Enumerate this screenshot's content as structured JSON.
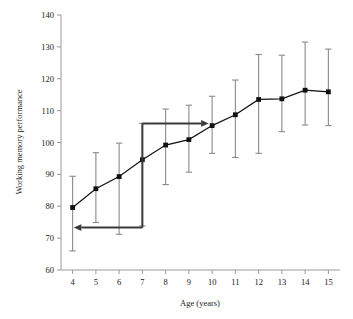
{
  "chart_data": {
    "type": "line",
    "title": "",
    "xlabel": "Age (years)",
    "ylabel": "Working memory performance",
    "xlim": [
      3.5,
      15.5
    ],
    "ylim": [
      60,
      140
    ],
    "ytick_step": 10,
    "grid": false,
    "legend": "none",
    "x": [
      4,
      5,
      6,
      7,
      8,
      9,
      10,
      11,
      12,
      13,
      14,
      15
    ],
    "xticklabels": [
      "4",
      "5",
      "6",
      "7",
      "8",
      "9",
      "10",
      "11",
      "12",
      "13",
      "14",
      "15"
    ],
    "yticklabels": [
      "60",
      "70",
      "80",
      "90",
      "100",
      "110",
      "120",
      "130",
      "140"
    ],
    "series": [
      {
        "name": "Working memory performance",
        "values": [
          79.6,
          85.5,
          89.3,
          94.6,
          99.2,
          100.9,
          105.3,
          108.7,
          113.5,
          113.7,
          116.4,
          115.9
        ],
        "err_low": [
          66.0,
          74.9,
          71.2,
          73.8,
          86.8,
          90.7,
          96.6,
          95.3,
          96.6,
          103.4,
          105.5,
          105.3
        ],
        "err_high": [
          89.4,
          96.8,
          99.8,
          106.0,
          110.5,
          111.7,
          114.5,
          119.6,
          127.6,
          127.4,
          131.5,
          129.3
        ],
        "marker": "square",
        "color": "#111111",
        "errorbar_color": "#8a8a8a"
      }
    ],
    "annotations": [
      {
        "name": "forward-arrow",
        "type": "arrow",
        "direction": "right",
        "y": 106.0,
        "x_start": 7.0,
        "x_end": 9.85,
        "color": "#3a3a3a"
      },
      {
        "name": "backward-arrow",
        "type": "arrow",
        "direction": "left",
        "y": 73.3,
        "x_start": 7.0,
        "x_end": 4.05,
        "color": "#3a3a3a"
      },
      {
        "name": "reference-connector",
        "type": "vline",
        "x": 7.0,
        "y_start": 73.3,
        "y_end": 106.0,
        "color": "#3a3a3a"
      }
    ],
    "colors": {
      "line": "#111111",
      "marker": "#111111",
      "errorbar": "#8a8a8a",
      "axis": "#999999",
      "annotation": "#3a3a3a",
      "background": "#ffffff",
      "text": "#202020"
    }
  }
}
